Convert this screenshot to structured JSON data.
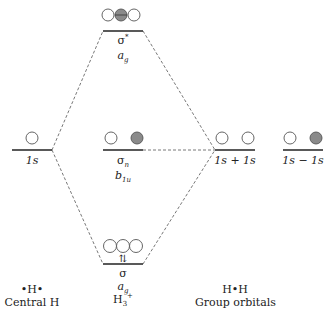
{
  "colors": {
    "line": "#222222",
    "dash": "#555555",
    "filled_lobe": "#8a8a8a",
    "empty_lobe": "#ffffff"
  },
  "levels": {
    "sigma_star": {
      "symbol": "σ*",
      "sym_label": "ag",
      "sym_main": "a",
      "sym_sub": "g"
    },
    "sigma_n": {
      "symbol": "σn",
      "sym_main": "b",
      "sym_sub": "1u",
      "sym_label": "b1u"
    },
    "sigma": {
      "symbol": "σ",
      "sym_main": "a",
      "sym_sub": "g",
      "sym_label": "ag",
      "electrons": "⇅",
      "molecule": "H3+"
    },
    "central_1s": {
      "label": "1s"
    },
    "group_plus": {
      "label": "1s + 1s"
    },
    "group_minus": {
      "label": "1s − 1s"
    }
  },
  "footers": {
    "left": {
      "symbol": "•H•",
      "caption": "Central H"
    },
    "mid": {
      "main": "H",
      "sub": "3",
      "sup": "+"
    },
    "right": {
      "symbol": "H•H",
      "caption": "Group orbitals"
    }
  }
}
